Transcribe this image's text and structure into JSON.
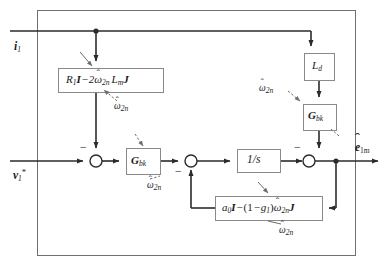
{
  "diagram": {
    "outer_box": {
      "name": "estimator-boundary"
    },
    "inputs": [
      {
        "id": "i1",
        "label": "i",
        "sub": "1",
        "style": "bold-italic"
      },
      {
        "id": "v1ref",
        "label": "v",
        "sub": "1",
        "sup": "*",
        "style": "bold-italic"
      }
    ],
    "outputs": [
      {
        "id": "e1m",
        "label": "e",
        "sub": "1m",
        "hat": true,
        "style": "bold-italic"
      }
    ],
    "blocks": [
      {
        "id": "block-r1",
        "name": "r1-block",
        "text": "R1I - 2w2n Lm J",
        "x": 58,
        "y": 68,
        "w": 105,
        "h": 24
      },
      {
        "id": "block-gbk-main",
        "name": "gbk-main-block",
        "text": "Gbk",
        "x": 126,
        "y": 148,
        "w": 34,
        "h": 26
      },
      {
        "id": "block-integrator",
        "name": "integrator-block",
        "text": "1/s",
        "x": 237,
        "y": 148,
        "w": 43,
        "h": 23
      },
      {
        "id": "block-ld",
        "name": "ld-block",
        "text": "Ld",
        "x": 304,
        "y": 53,
        "w": 30,
        "h": 27
      },
      {
        "id": "block-gbk-right",
        "name": "gbk-right-block",
        "text": "Gbk",
        "x": 303,
        "y": 104,
        "w": 33,
        "h": 26
      },
      {
        "id": "block-feedback",
        "name": "feedback-gain-block",
        "text": "a0I - (1 - g1) w2n J",
        "x": 215,
        "y": 196,
        "w": 107,
        "h": 24
      }
    ],
    "sum_junctions": [
      {
        "id": "sum-1",
        "name": "summing-junction-left",
        "cx": 96,
        "cy": 161,
        "r": 6,
        "signs": [
          "-"
        ]
      },
      {
        "id": "sum-2",
        "name": "summing-junction-middle",
        "cx": 191,
        "cy": 161,
        "r": 6,
        "signs": [
          "-"
        ]
      },
      {
        "id": "sum-3",
        "name": "summing-junction-right",
        "cx": 309,
        "cy": 161,
        "r": 6,
        "signs": [
          "-"
        ]
      }
    ],
    "annotations": [
      {
        "id": "ann-1",
        "name": "omega-annotation-r1-block",
        "text": "w2n",
        "x": 118,
        "y": 106
      },
      {
        "id": "ann-2",
        "name": "omega-annotation-gbk-main",
        "text": "w2n",
        "x": 148,
        "y": 184
      },
      {
        "id": "ann-3",
        "name": "omega-annotation-gbk-right",
        "text": "w2n",
        "x": 263,
        "y": 85
      },
      {
        "id": "ann-4",
        "name": "omega-annotation-feedback",
        "text": "w2n",
        "x": 282,
        "y": 229
      }
    ]
  },
  "labels": {
    "i1": "i",
    "i1_sub": "1",
    "v1": "v",
    "v1_sub": "1",
    "v1_sup": "*",
    "e1m": "e",
    "e1m_sub": "1m",
    "ld": "L",
    "ld_sub": "d",
    "gbk": "G",
    "gbk_sub": "bk",
    "integrator": "1/s",
    "omega": "ω",
    "omega_sub": "2n",
    "hat": "ˆ",
    "minus": "−",
    "r1": "R",
    "r1_sub": "1",
    "I": "I",
    "two": "2",
    "Lm": "L",
    "Lm_sub": "m",
    "J": "J",
    "a0": "a",
    "a0_sub": "0",
    "open_paren": "(",
    "one": "1",
    "g1": "g",
    "g1_sub": "1",
    "close_paren": ")"
  },
  "colors": {
    "line": "#2b2b2b",
    "block_border": "#8a8a8a",
    "outer_border": "#6f6f6f",
    "text": "#1a1a1a",
    "background": "#ffffff",
    "dashed": "#9a9a9a"
  }
}
